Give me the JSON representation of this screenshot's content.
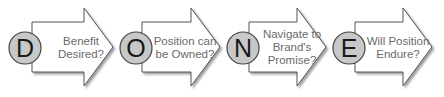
{
  "diagram": {
    "type": "process-arrows",
    "acronym": "DONE",
    "colors": {
      "arrow_fill": "#ffffff",
      "arrow_stroke": "#555555",
      "arrow_shadow": "#9a9a9a",
      "circle_fill": "#c8c8c8",
      "circle_stroke": "#444444",
      "letter_color": "#1a1a1a",
      "label_color": "#6a6a6a"
    },
    "steps": [
      {
        "letter": "D",
        "label_lines": [
          "Benefit",
          "Desired?"
        ]
      },
      {
        "letter": "O",
        "label_lines": [
          "Position can",
          "be Owned?"
        ]
      },
      {
        "letter": "N",
        "label_lines": [
          "Navigate to",
          "Brand's",
          "Promise?"
        ]
      },
      {
        "letter": "E",
        "label_lines": [
          "Will Position",
          "Endure?"
        ]
      }
    ]
  }
}
